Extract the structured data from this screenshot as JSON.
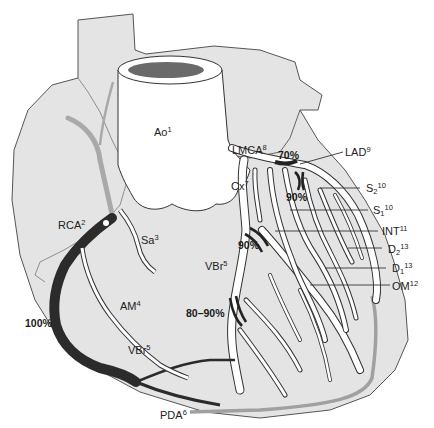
{
  "colors": {
    "heart_fill": "#e4e4e4",
    "outline": "#555555",
    "vessel_fill": "#ffffff",
    "vessel_outline": "#333333",
    "occluded_vessel": "#2b2b2b",
    "posterior_vessel": "#a9a9a9",
    "aorta_lumen": "#6a6a6a"
  },
  "labels": {
    "ao": {
      "text": "Ao",
      "sup": "1"
    },
    "rca": {
      "text": "RCA",
      "sup": "2"
    },
    "sa": {
      "text": "Sa",
      "sup": "3"
    },
    "am": {
      "text": "AM",
      "sup": "4"
    },
    "vbr_left": {
      "text": "VBr",
      "sup": "5"
    },
    "vbr_bottom": {
      "text": "VBr",
      "sup": "5"
    },
    "pda": {
      "text": "PDA",
      "sup": "6"
    },
    "cx": {
      "text": "Cx",
      "sup": "7"
    },
    "lmca": {
      "text": "LMCA",
      "sup": "8"
    },
    "lad": {
      "text": "LAD",
      "sup": "9"
    },
    "s2": {
      "text": "S",
      "sub": "2",
      "sup": "10"
    },
    "s1": {
      "text": "S",
      "sub": "1",
      "sup": "10"
    },
    "int": {
      "text": "INT",
      "sup": "11"
    },
    "d2": {
      "text": "D",
      "sub": "2",
      "sup": "13"
    },
    "d1": {
      "text": "D",
      "sub": "1",
      "sup": "13"
    },
    "om": {
      "text": "OM",
      "sup": "12"
    }
  },
  "stenoses": {
    "lmca_lad": "70%",
    "lad_proximal": "90%",
    "int": "90%",
    "vbr_mid": "80–90%",
    "rca": "100%"
  }
}
